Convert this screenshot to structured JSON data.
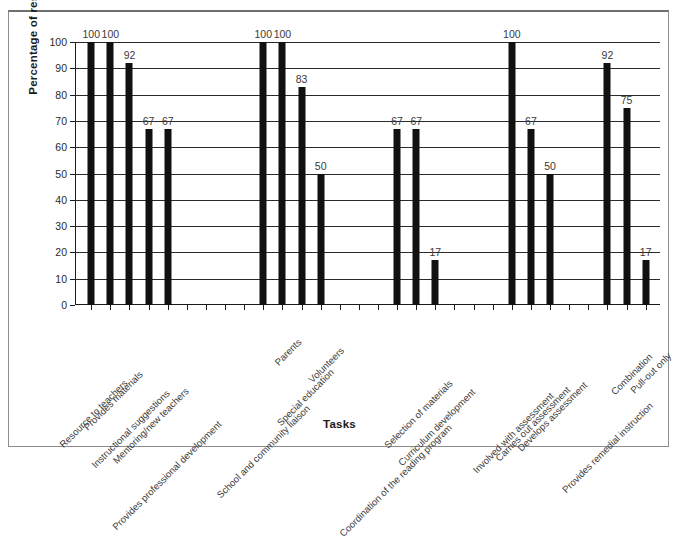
{
  "chart_data": {
    "type": "bar",
    "title": "",
    "xlabel": "Tasks",
    "ylabel": "Percentage of respondents",
    "ylim": [
      0,
      100
    ],
    "ytick_step": 10,
    "yticks": [
      0,
      10,
      20,
      30,
      40,
      50,
      60,
      70,
      80,
      90,
      100
    ],
    "grid": "horizontal",
    "legend": "none",
    "bar_color": "#111111",
    "background_color": "#ffffff",
    "value_labels": true,
    "categories": [
      "Resource to teachers",
      "Provides materials",
      "Instructional suggestions",
      "Mentoring/new teachers",
      "Provides professional development",
      "School and community liaison",
      "Parents",
      "Special education",
      "Volunteers",
      "Coordination of the reading program",
      "Selection of materials",
      "Curriculum development",
      "Involved with assessment",
      "Carries out assessment",
      "Develops assessment",
      "Provides remedial instruction",
      "Combination",
      "Pull-out only"
    ],
    "values": [
      100,
      100,
      92,
      67,
      67,
      100,
      100,
      83,
      50,
      67,
      67,
      17,
      100,
      67,
      50,
      92,
      75,
      17
    ],
    "groups": [
      {
        "name": "Support to teachers",
        "categories": [
          "Resource to teachers",
          "Provides materials",
          "Instructional suggestions",
          "Mentoring/new teachers",
          "Provides professional development"
        ],
        "values": [
          100,
          100,
          92,
          67,
          67
        ]
      },
      {
        "name": "Liaison roles",
        "categories": [
          "School and community liaison",
          "Parents",
          "Special education",
          "Volunteers"
        ],
        "values": [
          100,
          100,
          83,
          50
        ]
      },
      {
        "name": "Program and materials",
        "categories": [
          "Coordination of the reading program",
          "Selection of materials",
          "Curriculum development"
        ],
        "values": [
          67,
          67,
          17
        ]
      },
      {
        "name": "Assessment",
        "categories": [
          "Involved with assessment",
          "Carries out assessment",
          "Develops assessment"
        ],
        "values": [
          100,
          67,
          50
        ]
      },
      {
        "name": "Instruction model",
        "categories": [
          "Provides remedial instruction",
          "Combination",
          "Pull-out only"
        ],
        "values": [
          92,
          75,
          17
        ]
      }
    ],
    "slot_count": 30,
    "slot_layout": [
      {
        "slot": 1,
        "category": "Resource to teachers",
        "value": 100
      },
      {
        "slot": 2,
        "category": "Provides materials",
        "value": 100
      },
      {
        "slot": 3,
        "category": "Instructional suggestions",
        "value": 92
      },
      {
        "slot": 4,
        "category": "Mentoring/new teachers",
        "value": 67
      },
      {
        "slot": 5,
        "category": "Provides professional development",
        "value": 67
      },
      {
        "slot": 6,
        "category": "",
        "value": null
      },
      {
        "slot": 7,
        "category": "",
        "value": null
      },
      {
        "slot": 8,
        "category": "",
        "value": null
      },
      {
        "slot": 9,
        "category": "",
        "value": null
      },
      {
        "slot": 10,
        "category": "School and community liaison",
        "value": 100
      },
      {
        "slot": 11,
        "category": "Parents",
        "value": 100
      },
      {
        "slot": 12,
        "category": "Special education",
        "value": 83
      },
      {
        "slot": 13,
        "category": "Volunteers",
        "value": 50
      },
      {
        "slot": 14,
        "category": "",
        "value": null
      },
      {
        "slot": 15,
        "category": "",
        "value": null
      },
      {
        "slot": 16,
        "category": "",
        "value": null
      },
      {
        "slot": 17,
        "category": "Coordination of the reading program",
        "value": 67
      },
      {
        "slot": 18,
        "category": "Selection of materials",
        "value": 67
      },
      {
        "slot": 19,
        "category": "Curriculum development",
        "value": 17
      },
      {
        "slot": 20,
        "category": "",
        "value": null
      },
      {
        "slot": 21,
        "category": "",
        "value": null
      },
      {
        "slot": 22,
        "category": "",
        "value": null
      },
      {
        "slot": 23,
        "category": "Involved with assessment",
        "value": 100
      },
      {
        "slot": 24,
        "category": "Carries out assessment",
        "value": 67
      },
      {
        "slot": 25,
        "category": "Develops assessment",
        "value": 50
      },
      {
        "slot": 26,
        "category": "",
        "value": null
      },
      {
        "slot": 27,
        "category": "",
        "value": null
      },
      {
        "slot": 28,
        "category": "Provides remedial instruction",
        "value": 92
      },
      {
        "slot": 29,
        "category": "Combination",
        "value": 75
      },
      {
        "slot": 30,
        "category": "Pull-out only",
        "value": 17
      }
    ]
  }
}
